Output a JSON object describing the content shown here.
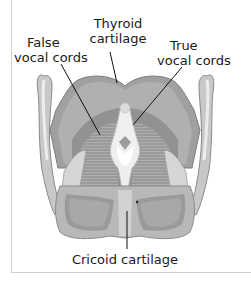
{
  "diagram": {
    "labels": {
      "thyroid_cartilage": {
        "line1": "Thyroid",
        "line2": "cartilage"
      },
      "false_vocal_cords": {
        "line1": "False",
        "line2": "vocal cords"
      },
      "true_vocal_cords": {
        "line1": "True",
        "line2": "vocal cords"
      },
      "cricoid_cartilage": {
        "text": "Cricoid cartilage"
      }
    },
    "colors": {
      "cartilage_dark": "#8a8a8a",
      "cartilage_mid": "#a6a6a6",
      "cartilage_light": "#c8c8c8",
      "highlight": "#e6e6e6",
      "leader_line": "#111111",
      "frame_border": "#cfcfcf"
    }
  }
}
